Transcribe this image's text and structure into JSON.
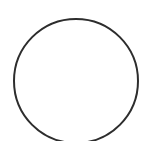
{
  "canvas": {
    "width": "145",
    "height": "141",
    "background": "#ffffff"
  },
  "figure": {
    "type": "circle-outline",
    "circle": {
      "cx": "76",
      "cy": "81",
      "r": "62",
      "stroke": "#2d2d2d",
      "stroke_width": "2",
      "fill": "none",
      "stroke_linecap": "round"
    }
  }
}
